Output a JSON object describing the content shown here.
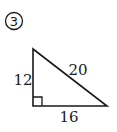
{
  "problem": {
    "number_label": "3",
    "number_style": "circled"
  },
  "triangle": {
    "type": "right-triangle",
    "vertices": {
      "top": [
        33,
        49
      ],
      "right_angle": [
        33,
        106
      ],
      "bottom_right": [
        107,
        106
      ]
    },
    "right_angle_marker_size": 9,
    "sides": {
      "vertical_leg": {
        "label": "12"
      },
      "horizontal_leg": {
        "label": "16"
      },
      "hypotenuse": {
        "label": "20"
      }
    },
    "stroke_color": "#1a1a1a"
  }
}
